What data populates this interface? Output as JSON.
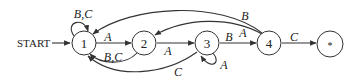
{
  "diagram": {
    "type": "finite-state-automaton",
    "start_label": "START",
    "states": [
      {
        "id": "1",
        "label": "1"
      },
      {
        "id": "2",
        "label": "2"
      },
      {
        "id": "3",
        "label": "3"
      },
      {
        "id": "4",
        "label": "4"
      },
      {
        "id": "accept",
        "label": "*"
      }
    ],
    "transitions": [
      {
        "from": "1",
        "to": "1",
        "label": "B,C"
      },
      {
        "from": "1",
        "to": "2",
        "label": "A"
      },
      {
        "from": "2",
        "to": "1",
        "label": "B,C"
      },
      {
        "from": "2",
        "to": "3",
        "label": "A"
      },
      {
        "from": "3",
        "to": "3",
        "label": "A"
      },
      {
        "from": "3",
        "to": "1",
        "label": "C"
      },
      {
        "from": "3",
        "to": "4",
        "label": "B"
      },
      {
        "from": "4",
        "to": "1",
        "label": "B"
      },
      {
        "from": "4",
        "to": "2",
        "label": "A"
      },
      {
        "from": "4",
        "to": "accept",
        "label": "C"
      }
    ]
  }
}
